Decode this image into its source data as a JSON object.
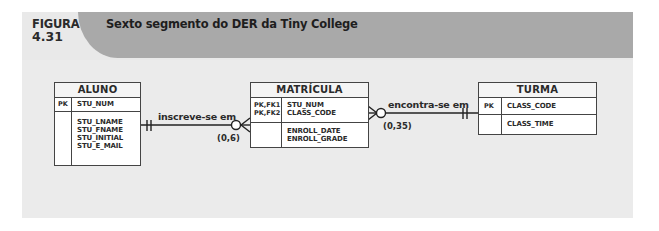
{
  "figure": {
    "label": "FIGURA",
    "number": "4.31",
    "title": "Sexto segmento do DER da Tiny College"
  },
  "colors": {
    "title_bar": "#a9a9a9",
    "panel": "#ebebeb",
    "entity_border": "#444444",
    "line": "#222222"
  },
  "entities": {
    "aluno": {
      "name": "ALUNO",
      "key_label": "PK",
      "keys": [
        "STU_NUM"
      ],
      "attributes": [
        "STU_LNAME",
        "STU_FNAME",
        "STU_INITIAL",
        "STU_E_MAIL"
      ]
    },
    "matricula": {
      "name": "MATRÍCULA",
      "key_labels": [
        "PK,FK1",
        "PK,FK2"
      ],
      "keys": [
        "STU_NUM",
        "CLASS_CODE"
      ],
      "attributes": [
        "ENROLL_DATE",
        "ENROLL_GRADE"
      ]
    },
    "turma": {
      "name": "TURMA",
      "key_label": "PK",
      "keys": [
        "CLASS_CODE"
      ],
      "attributes": [
        "CLASS_TIME"
      ]
    }
  },
  "relationships": [
    {
      "label": "inscreve-se em",
      "from": "ALUNO",
      "to": "MATRÍCULA",
      "from_notation": "one-and-only-one",
      "to_notation": "zero-or-many",
      "cardinality": "(0,6)"
    },
    {
      "label": "encontra-se em",
      "from": "MATRÍCULA",
      "to": "TURMA",
      "from_notation": "zero-or-many",
      "to_notation": "one-and-only-one",
      "cardinality": "(0,35)"
    }
  ]
}
